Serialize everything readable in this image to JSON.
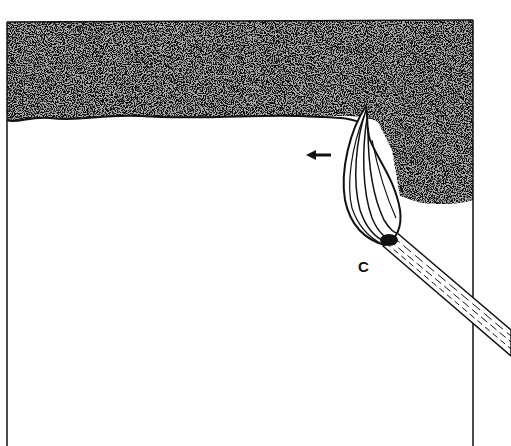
{
  "figure": {
    "label": "C",
    "arrow_direction": "left",
    "colors": {
      "ink": "#111111",
      "paper": "#ffffff"
    }
  }
}
